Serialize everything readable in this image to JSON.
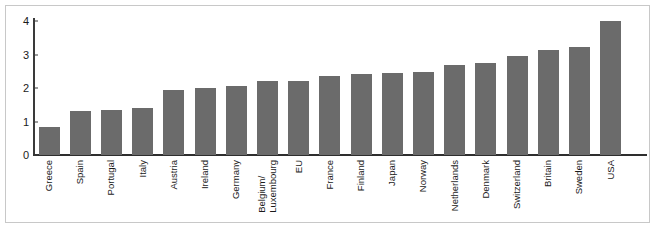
{
  "chart_data": {
    "type": "bar",
    "title": "",
    "subtitle": "",
    "xlabel": "",
    "ylabel": "",
    "ylim": [
      0,
      4
    ],
    "yticks": [
      0,
      1,
      2,
      3,
      4
    ],
    "ytick_labels": [
      "0",
      "1",
      "2",
      "3",
      "4"
    ],
    "grid": false,
    "legend": null,
    "bar_color": "#6b6b6b",
    "axis_color": "#2e2e2e",
    "frame_color": "#c8c8c8",
    "background": "#ffffff",
    "categories": [
      "Greece",
      "Spain",
      "Portugal",
      "Italy",
      "Austria",
      "Ireland",
      "Germany",
      "Belgium/\nLuxembourg",
      "EU",
      "France",
      "Finland",
      "Japan",
      "Norway",
      "Netherlands",
      "Denmark",
      "Switzerland",
      "Britain",
      "Sweden",
      "USA"
    ],
    "values": [
      0.85,
      1.32,
      1.33,
      1.4,
      1.93,
      2.0,
      2.05,
      2.2,
      2.2,
      2.35,
      2.43,
      2.45,
      2.47,
      2.68,
      2.76,
      2.96,
      3.13,
      3.23,
      4.0
    ]
  }
}
